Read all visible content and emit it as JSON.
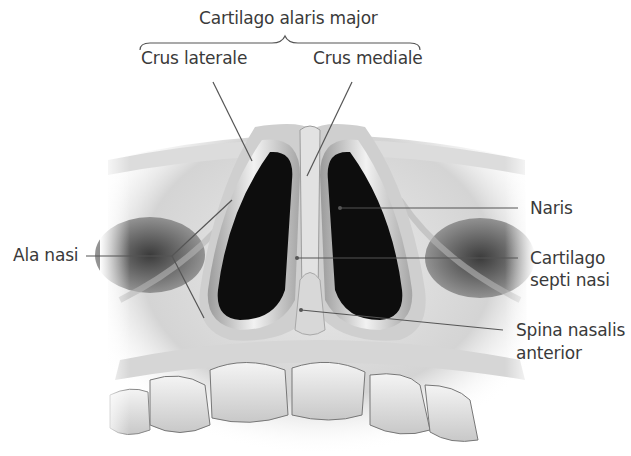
{
  "figure": {
    "labels": {
      "group_title": "Cartilago alaris major",
      "crus_laterale": "Crus laterale",
      "crus_mediale": "Crus mediale",
      "ala_nasi": "Ala nasi",
      "naris": "Naris",
      "cartilago_septi_nasi_line1": "Cartilago",
      "cartilago_septi_nasi_line2": "septi nasi",
      "spina_nasalis_line1": "Spina nasalis",
      "spina_nasalis_line2": "anterior"
    },
    "colors": {
      "text": "#3a3a3a",
      "leader_line": "#555555",
      "background": "#ffffff",
      "skin_light": "#e6e6e6",
      "skin_mid": "#bdbdbd",
      "nostril": "#0d0d0d"
    }
  }
}
